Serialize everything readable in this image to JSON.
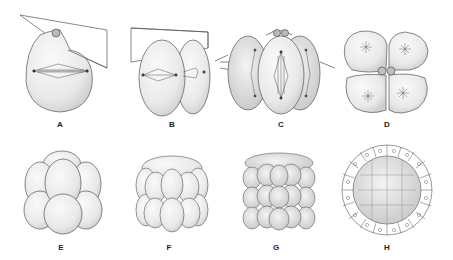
{
  "figure": {
    "panels": [
      {
        "id": "A",
        "label": "A",
        "stage": "first cleavage, single cell with spindle and polar body",
        "label_x": 60,
        "label_y": 120
      },
      {
        "id": "B",
        "label": "B",
        "stage": "two-cell stage with second cleavage plane",
        "label_x": 172,
        "label_y": 120
      },
      {
        "id": "C",
        "label": "C",
        "stage": "four-cell stage dividing",
        "label_x": 281,
        "label_y": 120
      },
      {
        "id": "D",
        "label": "D",
        "stage": "four-cell stage top view with polar bodies",
        "label_x": 387,
        "label_y": 120
      },
      {
        "id": "E",
        "label": "E",
        "stage": "eight-cell stage",
        "label_x": 61,
        "label_y": 243
      },
      {
        "id": "F",
        "label": "F",
        "stage": "sixteen-cell stage",
        "label_x": 169,
        "label_y": 243
      },
      {
        "id": "G",
        "label": "G",
        "stage": "morula",
        "label_x": 276,
        "label_y": 243
      },
      {
        "id": "H",
        "label": "H",
        "stage": "blastula cross-section",
        "label_x": 387,
        "label_y": 243
      }
    ]
  },
  "colors": {
    "stroke": "#555555",
    "fill": "#f2f2f2",
    "shade": "#d8d8d8",
    "label": "#222222"
  }
}
